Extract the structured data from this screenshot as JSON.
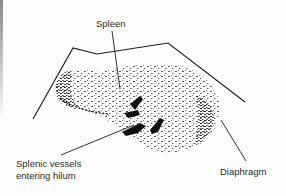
{
  "figure": {
    "type": "ultrasound-diagram",
    "subject": "spleen",
    "labels": {
      "spleen": "Spleen",
      "vessels_line1": "Splenic vessels",
      "vessels_line2": "entering hilum",
      "diaphragm": "Diaphragm"
    },
    "colors": {
      "ink": "#1a1a1a",
      "label_text": "#2a2a2a",
      "background": "#fdfdfd"
    }
  }
}
